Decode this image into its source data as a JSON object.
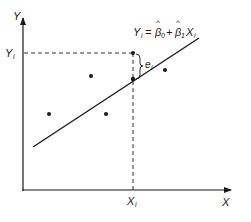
{
  "diagram": {
    "type": "regression-residual-illustration",
    "axes": {
      "y_label": "Y",
      "x_label": "X",
      "y_tick_label": "Y",
      "y_tick_subscript": "i",
      "x_tick_label": "X",
      "x_tick_subscript": "i"
    },
    "equation": {
      "lhs": "Y",
      "lhs_sub": "i",
      "equals": "=",
      "beta0": "β",
      "beta0_sub": "0",
      "hat": "^",
      "plus": "+",
      "beta1": "β",
      "beta1_sub": "1",
      "x": "X",
      "x_sub": "i"
    },
    "residual": {
      "label": "e",
      "subscript": "i"
    },
    "points": [
      {
        "x": 49,
        "y": 114
      },
      {
        "x": 91,
        "y": 76
      },
      {
        "x": 106,
        "y": 114
      },
      {
        "x": 133,
        "y": 53
      },
      {
        "x": 165,
        "y": 70
      }
    ],
    "fitted_point": {
      "x": 133,
      "y": 79
    },
    "regression_line": {
      "x1": 33,
      "y1": 147,
      "x2": 199,
      "y2": 38
    },
    "colors": {
      "ink": "#1a1a1a",
      "background": "#ffffff"
    }
  }
}
